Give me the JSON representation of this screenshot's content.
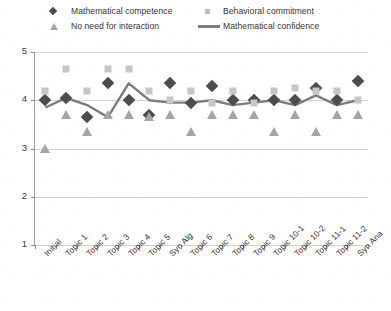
{
  "chart_data": {
    "type": "scatter",
    "title": "",
    "xlabel": "",
    "ylabel": "",
    "ylim": [
      1,
      5
    ],
    "yticks": [
      1,
      2,
      3,
      4,
      5
    ],
    "grid": true,
    "legend_position": "top",
    "categories": [
      "Initial",
      "Topic 1",
      "Topic 2",
      "Topic 3",
      "Topic 4",
      "Topic 5",
      "Syn Alg",
      "Topic 6",
      "Topic 7",
      "Topic 8",
      "Topic 9",
      "Topic 10-1",
      "Topic 10-2",
      "Topic 11-1",
      "Topic 11-2",
      "Syn Ana"
    ],
    "series": [
      {
        "name": "Mathematical competence",
        "marker": "diamond",
        "color": "#4d4d4d",
        "values": [
          4.0,
          4.05,
          3.65,
          4.35,
          4.0,
          3.7,
          4.35,
          3.95,
          4.3,
          4.0,
          4.0,
          4.0,
          4.0,
          4.25,
          4.0,
          4.4
        ]
      },
      {
        "name": "Behavioral commitment",
        "marker": "square",
        "color": "#c6c6c6",
        "values": [
          4.2,
          4.65,
          4.2,
          4.65,
          4.65,
          4.2,
          4.0,
          4.2,
          3.95,
          4.2,
          3.95,
          4.2,
          4.25,
          4.2,
          4.2,
          4.0
        ]
      },
      {
        "name": "No need for interaction",
        "marker": "triangle",
        "color": "#a5a5a5",
        "values": [
          3.0,
          3.7,
          3.35,
          3.7,
          3.7,
          3.65,
          3.7,
          3.35,
          3.7,
          3.7,
          3.7,
          3.35,
          3.7,
          3.35,
          3.7,
          3.7
        ]
      },
      {
        "name": "Mathematical confidence",
        "marker": "line",
        "color": "#7d7d7d",
        "values": [
          3.85,
          4.05,
          3.9,
          3.65,
          4.35,
          4.0,
          3.95,
          3.95,
          4.0,
          3.9,
          3.95,
          4.0,
          3.9,
          4.1,
          3.9,
          4.0
        ]
      }
    ]
  },
  "legend": {
    "items": [
      {
        "label": "Mathematical competence",
        "marker": "diamond-icon"
      },
      {
        "label": "Behavioral commitment",
        "marker": "square-icon"
      },
      {
        "label": "No need for interaction",
        "marker": "triangle-icon"
      },
      {
        "label": "Mathematical confidence",
        "marker": "line-icon"
      }
    ]
  },
  "axes": {
    "y_tick_labels": [
      "5",
      "4",
      "3",
      "2",
      "1"
    ]
  }
}
